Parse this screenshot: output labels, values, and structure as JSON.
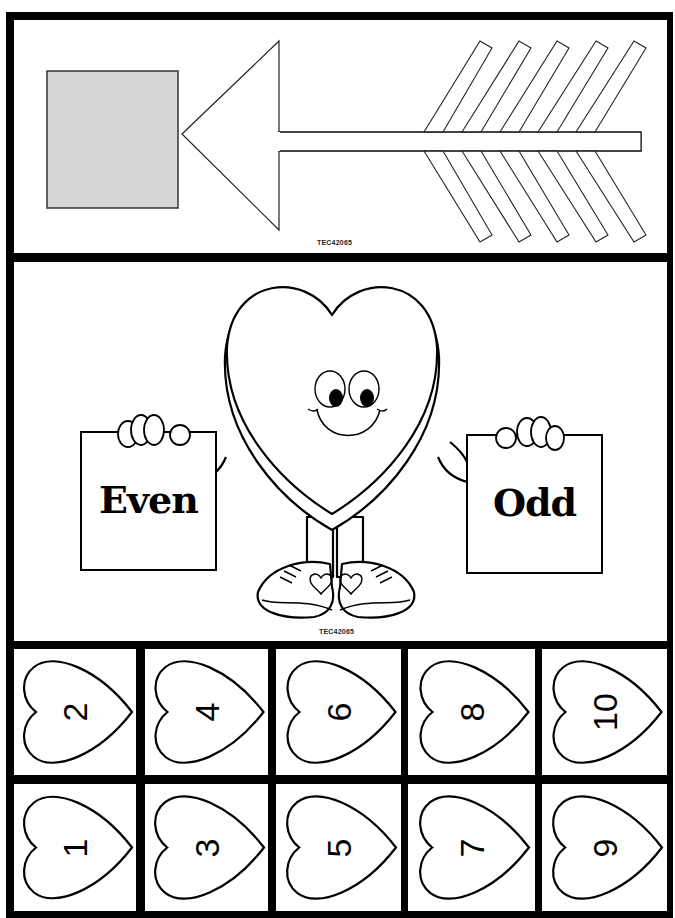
{
  "worksheet": {
    "arrow_card": {
      "code": "TEC42065",
      "square_fill": "#d6d6d6",
      "fletching_count": 5
    },
    "mascot_card": {
      "code": "TEC42065",
      "left_sign": "Even",
      "right_sign": "Odd"
    },
    "number_cards": {
      "rows": [
        [
          "2",
          "4",
          "6",
          "8",
          "10"
        ],
        [
          "1",
          "3",
          "5",
          "7",
          "9"
        ]
      ]
    },
    "colors": {
      "border": "#000000",
      "background": "#ffffff",
      "square_gray": "#d6d6d6"
    }
  }
}
